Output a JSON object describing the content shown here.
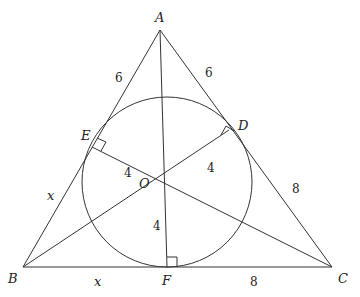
{
  "diagram": {
    "type": "triangle-incircle",
    "points": {
      "A": {
        "label": "A",
        "x": 160,
        "y": 30
      },
      "B": {
        "label": "B",
        "x": 23,
        "y": 267
      },
      "C": {
        "label": "C",
        "x": 332,
        "y": 267
      },
      "O": {
        "label": "O",
        "x": 167,
        "y": 182
      },
      "D": {
        "label": "D",
        "x": 229,
        "y": 130
      },
      "E": {
        "label": "E",
        "x": 92,
        "y": 147
      },
      "F": {
        "label": "F",
        "x": 167,
        "y": 267
      }
    },
    "circle": {
      "center": "O",
      "radius": 85
    },
    "segment_labels": {
      "AE": "6",
      "AD": "6",
      "BE": "x",
      "BF": "x",
      "CD": "8",
      "CF": "8",
      "OE": "4",
      "OD": "4",
      "OF": "4"
    },
    "right_angles": [
      "E",
      "D",
      "F"
    ]
  }
}
